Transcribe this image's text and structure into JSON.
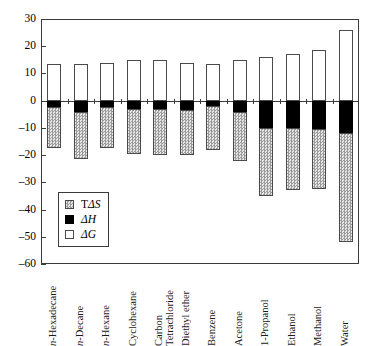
{
  "chart_data": {
    "type": "bar",
    "title": "",
    "subtitle": "",
    "xlabel": "",
    "ylabel": "",
    "ylim": [
      -60,
      30
    ],
    "ytick_values": [
      30,
      20,
      10,
      0,
      -10,
      -20,
      -30,
      -40,
      -50,
      -60
    ],
    "ytick_labels": [
      "30",
      "20",
      "10",
      "0",
      "-10",
      "-20",
      "-30",
      "-40",
      "-50",
      "-60"
    ],
    "grid": false,
    "stacked": true,
    "legend_position": "inside-lower-left",
    "categories": [
      "n-Hexadecane",
      "n-Decane",
      "n-Hexane",
      "Cyclohexane",
      "Carbon Tetrachloride",
      "Diethyl ether",
      "Benzene",
      "Acetone",
      "1-Propanol",
      "Ethanol",
      "Methanol",
      "Water"
    ],
    "category_italic_prefix": [
      "n-",
      "n-",
      "n-",
      "",
      "",
      "",
      "",
      "",
      "",
      "",
      "",
      ""
    ],
    "series": [
      {
        "name": "ΔG",
        "fill": "white",
        "values": [
          13.5,
          13.5,
          14.0,
          15.0,
          15.0,
          14.0,
          13.5,
          15.0,
          16.0,
          17.0,
          18.5,
          26.0
        ]
      },
      {
        "name": "ΔH",
        "fill": "black",
        "values": [
          -2.5,
          -4.0,
          -2.5,
          -3.0,
          -3.0,
          -3.5,
          -2.0,
          -4.0,
          -10.0,
          -10.0,
          -10.5,
          -12.0
        ]
      },
      {
        "name": "TΔS",
        "fill": "hatched",
        "values": [
          -15.0,
          -17.5,
          -15.0,
          -16.5,
          -17.0,
          -16.5,
          -16.0,
          -18.0,
          -25.0,
          -23.0,
          -22.0,
          -40.0
        ]
      }
    ],
    "series_cumulative_bottoms": [
      -17.5,
      -21.5,
      -17.5,
      -19.5,
      -20.0,
      -20.0,
      -18.0,
      -22.0,
      -35.0,
      -33.0,
      -32.5,
      -52.0
    ],
    "legend": [
      {
        "label": "TΔS",
        "swatch": "hatched"
      },
      {
        "label": "ΔH",
        "swatch": "black"
      },
      {
        "label": "ΔG",
        "swatch": "white"
      }
    ]
  },
  "colors": {
    "axis": "#3b3b3b",
    "bar_outline": "#4a4a4a",
    "dh_fill": "#000000",
    "dg_fill": "#ffffff",
    "tds_fill_dark": "#9b9b9b",
    "tds_fill_light": "#e8e8e8",
    "background": "#ffffff"
  }
}
